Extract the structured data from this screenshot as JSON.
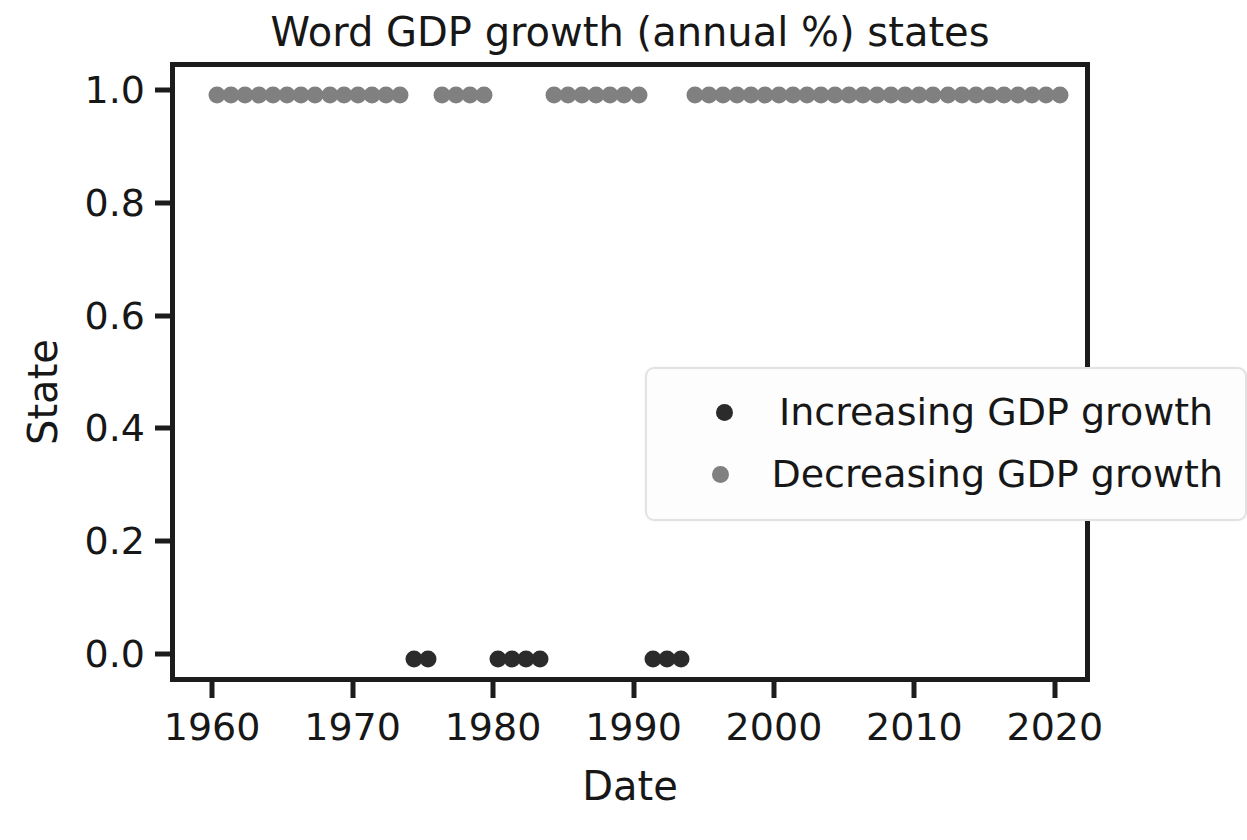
{
  "chart_data": {
    "type": "scatter",
    "title": "Word GDP growth (annual %) states",
    "xlabel": "Date",
    "ylabel": "State",
    "xlim": [
      1957.0,
      2022.5
    ],
    "ylim": [
      -0.05,
      1.05
    ],
    "grid": false,
    "legend_position": "center",
    "xticks": [
      "1960",
      "1970",
      "1980",
      "1990",
      "2000",
      "2010",
      "2020"
    ],
    "xtick_values": [
      1960,
      1970,
      1980,
      1990,
      2000,
      2010,
      2020
    ],
    "yticks": [
      "0.0",
      "0.2",
      "0.4",
      "0.6",
      "0.8",
      "1.0"
    ],
    "ytick_values": [
      0.0,
      0.2,
      0.4,
      0.6,
      0.8,
      1.0
    ],
    "series": [
      {
        "name": "Increasing GDP growth",
        "color": "#2b2b2b",
        "marker": "circle",
        "x": [
          1974,
          1975,
          1980,
          1981,
          1982,
          1983,
          1991,
          1992,
          1993
        ],
        "y": [
          0,
          0,
          0,
          0,
          0,
          0,
          0,
          0,
          0
        ]
      },
      {
        "name": "Decreasing GDP growth",
        "color": "#808080",
        "marker": "circle",
        "x": [
          1960,
          1961,
          1962,
          1963,
          1964,
          1965,
          1966,
          1967,
          1968,
          1969,
          1970,
          1971,
          1972,
          1973,
          1976,
          1977,
          1978,
          1979,
          1984,
          1985,
          1986,
          1987,
          1988,
          1989,
          1990,
          1994,
          1995,
          1996,
          1997,
          1998,
          1999,
          2000,
          2001,
          2002,
          2003,
          2004,
          2005,
          2006,
          2007,
          2008,
          2009,
          2010,
          2011,
          2012,
          2013,
          2014,
          2015,
          2016,
          2017,
          2018,
          2019,
          2020
        ],
        "y": [
          1,
          1,
          1,
          1,
          1,
          1,
          1,
          1,
          1,
          1,
          1,
          1,
          1,
          1,
          1,
          1,
          1,
          1,
          1,
          1,
          1,
          1,
          1,
          1,
          1,
          1,
          1,
          1,
          1,
          1,
          1,
          1,
          1,
          1,
          1,
          1,
          1,
          1,
          1,
          1,
          1,
          1,
          1,
          1,
          1,
          1,
          1,
          1,
          1,
          1,
          1,
          1
        ]
      }
    ]
  },
  "legend": {
    "items": [
      {
        "label": "Increasing GDP growth",
        "color": "#2b2b2b"
      },
      {
        "label": "Decreasing GDP growth",
        "color": "#808080"
      }
    ]
  },
  "colors": {
    "axis": "#1c1c1c",
    "text": "#171717",
    "background": "#ffffff",
    "increasing": "#2b2b2b",
    "decreasing": "#808080"
  }
}
